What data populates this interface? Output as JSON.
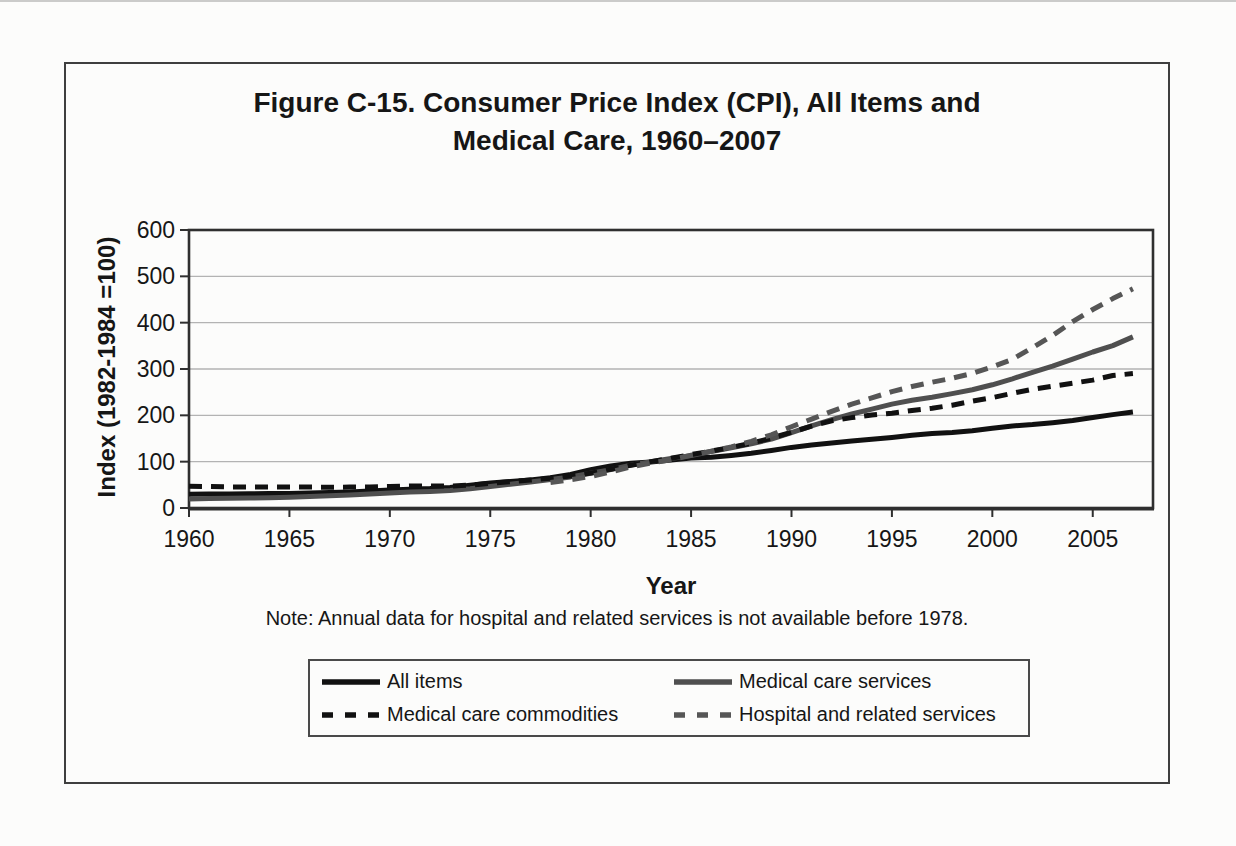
{
  "header": {
    "line1": "Figure C-15. Consumer Price Index (CPI), All Items and",
    "line2": "Medical Care, 1960–2007"
  },
  "note_text": "Note: Annual data for hospital and related services is not available before 1978.",
  "chart_data": {
    "type": "line",
    "title": "Figure C-15. Consumer Price Index (CPI), All Items and Medical Care, 1960–2007",
    "xlabel": "Year",
    "ylabel": "Index (1982-1984 =100)",
    "xlim": [
      1960,
      2008
    ],
    "ylim": [
      0,
      600
    ],
    "xticks": [
      1960,
      1965,
      1970,
      1975,
      1980,
      1985,
      1990,
      1995,
      2000,
      2005
    ],
    "yticks": [
      0,
      100,
      200,
      300,
      400,
      500,
      600
    ],
    "grid": "horizontal gridlines at each 100",
    "legend_position": "boxed legend below chart, 2 columns",
    "note": "Note: Annual data for hospital and related services is not available before 1978.",
    "frame_color": "#2f2f2f",
    "gridline_color": "#b3b3b3",
    "series": [
      {
        "name": "All items",
        "style": "solid",
        "color": "#111111",
        "x_start": 1960,
        "values": [
          29.6,
          29.9,
          30.2,
          30.6,
          31.0,
          31.5,
          32.4,
          33.4,
          34.8,
          36.7,
          38.8,
          40.5,
          41.8,
          44.4,
          49.3,
          53.8,
          56.9,
          60.6,
          65.2,
          72.6,
          82.4,
          90.9,
          96.5,
          99.6,
          103.9,
          107.6,
          109.6,
          113.6,
          118.3,
          124.0,
          130.7,
          136.2,
          140.3,
          144.5,
          148.2,
          152.4,
          156.9,
          160.5,
          163.0,
          166.6,
          172.2,
          177.1,
          179.9,
          184.0,
          188.9,
          195.3,
          201.6,
          207.3
        ]
      },
      {
        "name": "Medical care services",
        "style": "solid",
        "color": "#4f4f4f",
        "x_start": 1960,
        "values": [
          19.5,
          20.2,
          20.9,
          21.5,
          22.3,
          23.2,
          24.7,
          26.5,
          28.3,
          30.3,
          32.3,
          34.7,
          35.9,
          37.5,
          41.4,
          46.6,
          51.3,
          56.4,
          61.2,
          67.2,
          74.8,
          82.8,
          92.6,
          100.1,
          106.8,
          113.2,
          121.9,
          130.0,
          138.3,
          148.9,
          162.7,
          177.1,
          190.5,
          202.9,
          213.4,
          224.2,
          232.4,
          239.1,
          246.8,
          255.1,
          266.0,
          278.8,
          292.9,
          306.0,
          321.3,
          336.7,
          350.6,
          369.3
        ]
      },
      {
        "name": "Medical care commodities",
        "style": "dashed",
        "color": "#111111",
        "x_start": 1960,
        "values": [
          46.9,
          46.3,
          45.6,
          45.2,
          45.1,
          45.0,
          45.1,
          44.9,
          45.0,
          45.4,
          46.5,
          47.3,
          47.4,
          47.5,
          49.2,
          53.3,
          56.5,
          60.2,
          64.4,
          69.0,
          75.4,
          83.7,
          92.3,
          100.2,
          107.5,
          115.2,
          122.8,
          131.0,
          139.9,
          150.8,
          163.4,
          176.8,
          188.1,
          195.0,
          200.7,
          204.5,
          210.4,
          215.3,
          221.8,
          230.7,
          238.1,
          247.6,
          256.4,
          262.8,
          269.3,
          276.0,
          285.9,
          290.0
        ]
      },
      {
        "name": "Hospital and related services",
        "style": "dashed",
        "color": "#565656",
        "x_start": 1978,
        "values": [
          55.1,
          61.0,
          68.0,
          77.9,
          88.7,
          97.0,
          104.3,
          113.7,
          122.5,
          131.6,
          143.9,
          158.0,
          175.4,
          191.9,
          208.7,
          224.2,
          237.6,
          251.2,
          262.2,
          271.5,
          280.1,
          290.6,
          304.6,
          320.9,
          345.9,
          372.5,
          402.4,
          428.5,
          452.0,
          473.0
        ]
      }
    ]
  }
}
